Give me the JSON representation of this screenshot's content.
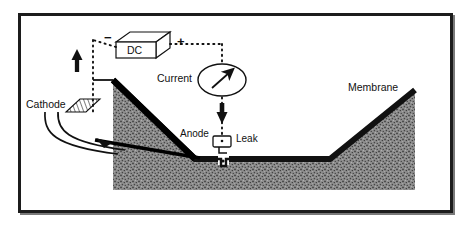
{
  "figure": {
    "type": "schematic-diagram"
  },
  "labels": {
    "dc_supply": "DC",
    "negative_terminal": "−",
    "positive_terminal": "+",
    "current": "Current",
    "cathode": "Cathode",
    "anode": "Anode",
    "leak": "Leak",
    "membrane": "Membrane"
  },
  "colors": {
    "frame": "#1c1c1c",
    "frame_shadow": "#7a7a7a",
    "soil_fill": "#8c8c8c",
    "membrane_line": "#111111",
    "wire": "#111111",
    "background": "#ffffff",
    "text": "#111111"
  },
  "components": [
    {
      "name": "dc-power-supply",
      "label": "DC",
      "shape": "3d-box"
    },
    {
      "name": "current-meter",
      "label": "Current",
      "shape": "ellipse-with-needle"
    },
    {
      "name": "cathode-electrode",
      "label": "Cathode",
      "shape": "hatched-plate"
    },
    {
      "name": "anode-electrode",
      "label": "Anode",
      "shape": "small-box"
    },
    {
      "name": "leak-point",
      "label": "Leak",
      "shape": "membrane-gap"
    },
    {
      "name": "membrane-liner",
      "label": "Membrane",
      "shape": "thick-v-line"
    },
    {
      "name": "soil-body",
      "label": "",
      "shape": "stippled-fill"
    }
  ],
  "flow_arrows": [
    {
      "name": "cathode-return-arrow",
      "direction": "up"
    },
    {
      "name": "current-to-anode-arrow",
      "direction": "down"
    }
  ]
}
